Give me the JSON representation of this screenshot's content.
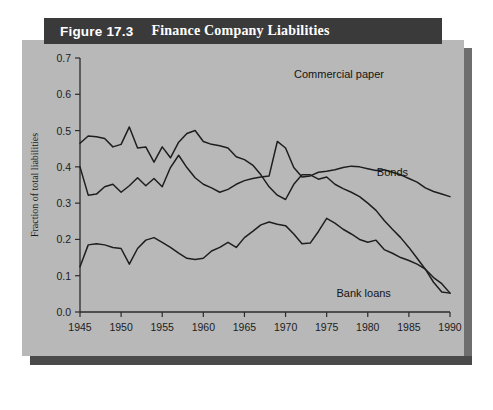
{
  "figure": {
    "number_label": "Figure 17.3",
    "title": "Finance Company Liabilities"
  },
  "chart_data": {
    "type": "line",
    "title": "Finance Company Liabilities",
    "xlabel": "",
    "ylabel": "Fraction of total liabilities",
    "xlim": [
      1945,
      1990
    ],
    "ylim": [
      0.0,
      0.7
    ],
    "xticks": [
      1945,
      1950,
      1955,
      1960,
      1965,
      1970,
      1975,
      1980,
      1985,
      1990
    ],
    "yticks": [
      "0.0",
      "0.1",
      "0.2",
      "0.3",
      "0.4",
      "0.5",
      "0.6",
      "0.7"
    ],
    "grid": false,
    "legend_position": "inline-annotations",
    "x": [
      1945,
      1946,
      1947,
      1948,
      1949,
      1950,
      1951,
      1952,
      1953,
      1954,
      1955,
      1956,
      1957,
      1958,
      1959,
      1960,
      1961,
      1962,
      1963,
      1964,
      1965,
      1966,
      1967,
      1968,
      1969,
      1970,
      1971,
      1972,
      1973,
      1974,
      1975,
      1976,
      1977,
      1978,
      1979,
      1980,
      1981,
      1982,
      1983,
      1984,
      1985,
      1986,
      1987,
      1988,
      1989,
      1990
    ],
    "series": [
      {
        "name": "Bank loans",
        "values": [
          0.465,
          0.485,
          0.483,
          0.478,
          0.455,
          0.462,
          0.51,
          0.452,
          0.455,
          0.413,
          0.455,
          0.425,
          0.468,
          0.492,
          0.5,
          0.47,
          0.462,
          0.458,
          0.452,
          0.428,
          0.42,
          0.405,
          0.378,
          0.345,
          0.322,
          0.31,
          0.352,
          0.378,
          0.378,
          0.366,
          0.372,
          0.352,
          0.34,
          0.33,
          0.318,
          0.3,
          0.28,
          0.252,
          0.228,
          0.205,
          0.178,
          0.148,
          0.118,
          0.082,
          0.055,
          0.052
        ]
      },
      {
        "name": "Bonds",
        "values": [
          0.4,
          0.322,
          0.325,
          0.345,
          0.352,
          0.33,
          0.348,
          0.37,
          0.348,
          0.368,
          0.345,
          0.398,
          0.432,
          0.398,
          0.37,
          0.352,
          0.342,
          0.33,
          0.338,
          0.352,
          0.362,
          0.368,
          0.372,
          0.375,
          0.47,
          0.452,
          0.398,
          0.372,
          0.375,
          0.385,
          0.388,
          0.392,
          0.398,
          0.402,
          0.4,
          0.395,
          0.39,
          0.392,
          0.385,
          0.378,
          0.368,
          0.358,
          0.342,
          0.332,
          0.325,
          0.318
        ]
      },
      {
        "name": "Commercial paper",
        "values": [
          0.125,
          0.185,
          0.188,
          0.185,
          0.178,
          0.175,
          0.132,
          0.175,
          0.198,
          0.205,
          0.192,
          0.178,
          0.162,
          0.148,
          0.145,
          0.148,
          0.168,
          0.178,
          0.192,
          0.178,
          0.205,
          0.222,
          0.24,
          0.248,
          0.242,
          0.238,
          0.215,
          0.188,
          0.19,
          0.222,
          0.258,
          0.245,
          0.228,
          0.215,
          0.2,
          0.192,
          0.198,
          0.172,
          0.162,
          0.15,
          0.142,
          0.132,
          0.118,
          0.095,
          0.078,
          0.052
        ]
      }
    ],
    "annotations": [
      {
        "text": "Commercial paper",
        "x": 1976.5,
        "y": 0.645
      },
      {
        "text": "Bonds",
        "x": 1983.0,
        "y": 0.375
      },
      {
        "text": "Bank loans",
        "x": 1979.5,
        "y": 0.04
      }
    ]
  },
  "colors": {
    "panel_background": "#b8b8b8",
    "title_bar": "#3a3a3a",
    "title_text": "#ffffff",
    "line": "#1e1e1e",
    "axis": "#2b2b2b",
    "page_background": "#ffffff"
  }
}
